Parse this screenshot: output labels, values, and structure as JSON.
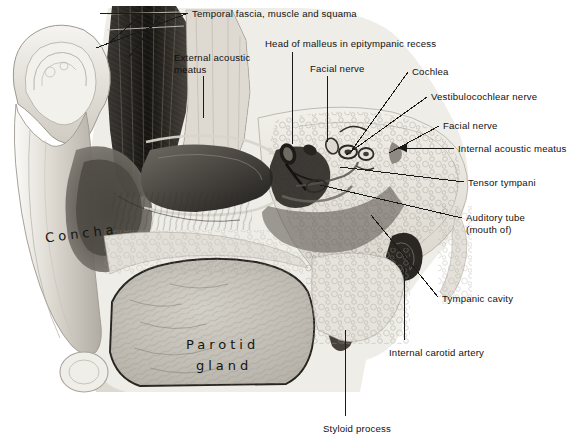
{
  "figure": {
    "kind": "anatomical-illustration",
    "palette": {
      "page_background": "#ffffff",
      "plate_background": "#f4f4f2",
      "ink": "#1a1a1a",
      "label_text": "#111111",
      "handwritten_text": "#16140f",
      "bone_light": "#e8e6e0",
      "soft_tissue_mid": "#b9b5ad",
      "cavity_dark": "#2f2d2a",
      "gland_fill": "#c9c6be"
    }
  },
  "labels": [
    {
      "id": "temporal-fascia",
      "text": "Temporal fascia, muscle and squama",
      "x": 192,
      "y": 8,
      "align": "left"
    },
    {
      "id": "external-acoustic-meatus",
      "text": "External acoustic\nmeatus",
      "x": 174,
      "y": 52,
      "align": "left"
    },
    {
      "id": "head-of-malleus",
      "text": "Head of malleus in epitympanic recess",
      "x": 265,
      "y": 38,
      "align": "left"
    },
    {
      "id": "facial-nerve-top",
      "text": "Facial nerve",
      "x": 310,
      "y": 63,
      "align": "left"
    },
    {
      "id": "cochlea",
      "text": "Cochlea",
      "x": 412,
      "y": 66,
      "align": "left"
    },
    {
      "id": "vestibulocochlear-nerve",
      "text": "Vestibulocochlear nerve",
      "x": 431,
      "y": 91,
      "align": "left"
    },
    {
      "id": "facial-nerve-right",
      "text": "Facial nerve",
      "x": 443,
      "y": 120,
      "align": "left"
    },
    {
      "id": "internal-acoustic-meatus",
      "text": "Internal acoustic meatus",
      "x": 458,
      "y": 143,
      "align": "left"
    },
    {
      "id": "tensor-tympani",
      "text": "Tensor tympani",
      "x": 468,
      "y": 177,
      "align": "left"
    },
    {
      "id": "auditory-tube",
      "text": "Auditory tube\n(mouth of)",
      "x": 466,
      "y": 212,
      "align": "left"
    },
    {
      "id": "tympanic-cavity",
      "text": "Tympanic cavity",
      "x": 442,
      "y": 293,
      "align": "left"
    },
    {
      "id": "internal-carotid-artery",
      "text": "Internal carotid artery",
      "x": 389,
      "y": 347,
      "align": "left"
    },
    {
      "id": "styloid-process",
      "text": "Styloid process",
      "x": 323,
      "y": 423,
      "align": "left"
    }
  ],
  "handwritten_labels": [
    {
      "id": "concha",
      "text": "Concha",
      "x": 45,
      "y": 226
    },
    {
      "id": "parotid-gland-line1",
      "text": "Parotid",
      "x": 186,
      "y": 337
    },
    {
      "id": "parotid-gland-line2",
      "text": "gland",
      "x": 196,
      "y": 358
    }
  ],
  "leader_lines": [
    {
      "id": "lead-temporal-fascia-a",
      "x1": 188,
      "y1": 13,
      "x2": 100,
      "y2": 13,
      "arrow": false
    },
    {
      "id": "lead-temporal-fascia-b",
      "x1": 186,
      "y1": 14,
      "x2": 96,
      "y2": 48,
      "arrow": false
    },
    {
      "id": "lead-temporal-fascia-c",
      "x1": 160,
      "y1": 16,
      "x2": 129,
      "y2": 57,
      "arrow": false
    },
    {
      "id": "lead-temporal-fascia-d",
      "x1": 142,
      "y1": 14,
      "x2": 108,
      "y2": 44,
      "arrow": false
    },
    {
      "id": "lead-external-acoustic-meatus",
      "x1": 203,
      "y1": 76,
      "x2": 203,
      "y2": 118,
      "arrow": false
    },
    {
      "id": "lead-head-of-malleus",
      "x1": 292,
      "y1": 52,
      "x2": 292,
      "y2": 144,
      "arrow": false
    },
    {
      "id": "lead-facial-nerve-top",
      "x1": 327,
      "y1": 76,
      "x2": 327,
      "y2": 142,
      "arrow": false
    },
    {
      "id": "lead-cochlea",
      "x1": 408,
      "y1": 72,
      "x2": 352,
      "y2": 150,
      "arrow": false
    },
    {
      "id": "lead-vestibulocochlear",
      "x1": 427,
      "y1": 97,
      "x2": 346,
      "y2": 155,
      "arrow": false
    },
    {
      "id": "lead-facial-nerve-right",
      "x1": 439,
      "y1": 126,
      "x2": 389,
      "y2": 153,
      "arrow": false
    },
    {
      "id": "lead-internal-acoustic-meatus",
      "x1": 454,
      "y1": 148,
      "x2": 398,
      "y2": 148,
      "arrow": true
    },
    {
      "id": "lead-tensor-tympani",
      "x1": 464,
      "y1": 182,
      "x2": 340,
      "y2": 167,
      "arrow": false
    },
    {
      "id": "lead-auditory-tube",
      "x1": 462,
      "y1": 218,
      "x2": 320,
      "y2": 185,
      "arrow": false
    },
    {
      "id": "lead-tympanic-cavity",
      "x1": 438,
      "y1": 297,
      "x2": 371,
      "y2": 215,
      "arrow": false
    },
    {
      "id": "lead-internal-carotid-artery",
      "x1": 404,
      "y1": 340,
      "x2": 404,
      "y2": 268,
      "arrow": false
    },
    {
      "id": "lead-styloid-process",
      "x1": 345,
      "y1": 416,
      "x2": 345,
      "y2": 330,
      "arrow": false
    }
  ]
}
